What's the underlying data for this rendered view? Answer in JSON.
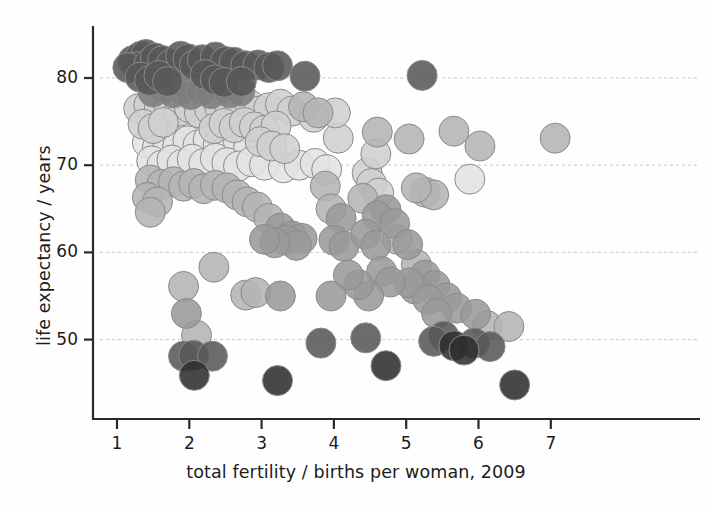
{
  "chart_data": {
    "type": "scatter",
    "title": "",
    "subtitle": "",
    "xlabel": "total fertility / births per woman, 2009",
    "ylabel": "life expectancy / years",
    "xlim": [
      0.55,
      7.6
    ],
    "ylim": [
      42.0,
      85.5
    ],
    "xticks": [
      1,
      2,
      3,
      4,
      5,
      6,
      7
    ],
    "xticklabels": [
      "1",
      "2",
      "3",
      "4",
      "5",
      "6",
      "7"
    ],
    "yticks": [
      50,
      60,
      70,
      80
    ],
    "yticklabels": [
      "50",
      "60",
      "70",
      "80"
    ],
    "grid": "horizontal-dashed-at-yticks",
    "legend": "none",
    "marker": {
      "shape": "circle",
      "radius_px": 15,
      "opacity": 0.88,
      "edge_color": "#8a8a8a",
      "edge_width_px": 1
    },
    "shade_palette": {
      "very-dark": "#2f2f2f",
      "dark": "#585858",
      "mid-dark": "#7d7d7d",
      "mid": "#9a9a9a",
      "mid-light": "#b4b4b4",
      "light": "#cfcfcf",
      "very-light": "#e3e3e3"
    },
    "n_points": 169,
    "points": [
      {
        "x": 1.22,
        "y": 82.0,
        "shade": "dark"
      },
      {
        "x": 1.33,
        "y": 82.5,
        "shade": "dark"
      },
      {
        "x": 1.4,
        "y": 82.7,
        "shade": "dark"
      },
      {
        "x": 1.28,
        "y": 81.3,
        "shade": "dark"
      },
      {
        "x": 1.15,
        "y": 81.2,
        "shade": "dark"
      },
      {
        "x": 1.44,
        "y": 81.6,
        "shade": "dark"
      },
      {
        "x": 1.53,
        "y": 82.3,
        "shade": "dark"
      },
      {
        "x": 1.63,
        "y": 82.0,
        "shade": "dark"
      },
      {
        "x": 1.75,
        "y": 81.6,
        "shade": "dark"
      },
      {
        "x": 1.88,
        "y": 82.5,
        "shade": "dark"
      },
      {
        "x": 1.98,
        "y": 82.2,
        "shade": "dark"
      },
      {
        "x": 2.07,
        "y": 81.5,
        "shade": "dark"
      },
      {
        "x": 2.18,
        "y": 82.1,
        "shade": "dark"
      },
      {
        "x": 2.36,
        "y": 82.4,
        "shade": "dark"
      },
      {
        "x": 2.5,
        "y": 81.9,
        "shade": "dark"
      },
      {
        "x": 2.62,
        "y": 81.8,
        "shade": "dark"
      },
      {
        "x": 2.78,
        "y": 81.4,
        "shade": "dark"
      },
      {
        "x": 2.95,
        "y": 81.5,
        "shade": "dark"
      },
      {
        "x": 3.1,
        "y": 81.2,
        "shade": "dark"
      },
      {
        "x": 3.22,
        "y": 81.4,
        "shade": "dark"
      },
      {
        "x": 1.32,
        "y": 80.1,
        "shade": "dark"
      },
      {
        "x": 1.45,
        "y": 79.7,
        "shade": "dark"
      },
      {
        "x": 1.58,
        "y": 80.3,
        "shade": "dark"
      },
      {
        "x": 1.7,
        "y": 79.6,
        "shade": "dark"
      },
      {
        "x": 1.82,
        "y": 80.0,
        "shade": "mid-dark"
      },
      {
        "x": 1.95,
        "y": 79.4,
        "shade": "mid-dark"
      },
      {
        "x": 2.08,
        "y": 79.9,
        "shade": "mid-dark"
      },
      {
        "x": 2.22,
        "y": 80.4,
        "shade": "dark"
      },
      {
        "x": 2.36,
        "y": 79.8,
        "shade": "dark"
      },
      {
        "x": 2.48,
        "y": 79.5,
        "shade": "dark"
      },
      {
        "x": 2.6,
        "y": 80.2,
        "shade": "mid-dark"
      },
      {
        "x": 2.72,
        "y": 79.6,
        "shade": "dark"
      },
      {
        "x": 1.5,
        "y": 78.4,
        "shade": "mid-dark"
      },
      {
        "x": 1.64,
        "y": 78.8,
        "shade": "mid-dark"
      },
      {
        "x": 1.78,
        "y": 78.3,
        "shade": "mid-dark"
      },
      {
        "x": 1.9,
        "y": 78.7,
        "shade": "mid-dark"
      },
      {
        "x": 2.02,
        "y": 78.1,
        "shade": "mid-dark"
      },
      {
        "x": 2.16,
        "y": 78.6,
        "shade": "mid-dark"
      },
      {
        "x": 2.3,
        "y": 78.2,
        "shade": "mid-dark"
      },
      {
        "x": 2.44,
        "y": 78.9,
        "shade": "mid-dark"
      },
      {
        "x": 2.56,
        "y": 78.3,
        "shade": "mid-dark"
      },
      {
        "x": 2.7,
        "y": 78.5,
        "shade": "mid-dark"
      },
      {
        "x": 3.6,
        "y": 80.2,
        "shade": "dark"
      },
      {
        "x": 5.22,
        "y": 80.3,
        "shade": "dark"
      },
      {
        "x": 1.3,
        "y": 76.5,
        "shade": "light"
      },
      {
        "x": 1.44,
        "y": 76.9,
        "shade": "light"
      },
      {
        "x": 1.58,
        "y": 76.3,
        "shade": "light"
      },
      {
        "x": 1.72,
        "y": 76.8,
        "shade": "light"
      },
      {
        "x": 1.86,
        "y": 76.2,
        "shade": "light"
      },
      {
        "x": 2.0,
        "y": 76.6,
        "shade": "light"
      },
      {
        "x": 2.14,
        "y": 76.0,
        "shade": "light"
      },
      {
        "x": 2.28,
        "y": 76.4,
        "shade": "light"
      },
      {
        "x": 2.42,
        "y": 76.7,
        "shade": "light"
      },
      {
        "x": 2.56,
        "y": 76.1,
        "shade": "light"
      },
      {
        "x": 2.7,
        "y": 76.5,
        "shade": "light"
      },
      {
        "x": 2.84,
        "y": 76.9,
        "shade": "light"
      },
      {
        "x": 2.96,
        "y": 76.2,
        "shade": "light"
      },
      {
        "x": 3.1,
        "y": 76.6,
        "shade": "light"
      },
      {
        "x": 3.26,
        "y": 77.0,
        "shade": "light"
      },
      {
        "x": 3.42,
        "y": 76.2,
        "shade": "light"
      },
      {
        "x": 3.58,
        "y": 76.7,
        "shade": "mid-light"
      },
      {
        "x": 3.78,
        "y": 76.0,
        "shade": "mid-light"
      },
      {
        "x": 1.36,
        "y": 74.7,
        "shade": "light"
      },
      {
        "x": 1.5,
        "y": 74.2,
        "shade": "light"
      },
      {
        "x": 1.64,
        "y": 74.9,
        "shade": "light"
      },
      {
        "x": 1.78,
        "y": 74.3,
        "shade": "very-light"
      },
      {
        "x": 1.92,
        "y": 74.8,
        "shade": "very-light"
      },
      {
        "x": 2.06,
        "y": 74.1,
        "shade": "very-light"
      },
      {
        "x": 2.2,
        "y": 74.6,
        "shade": "very-light"
      },
      {
        "x": 2.34,
        "y": 74.2,
        "shade": "light"
      },
      {
        "x": 2.48,
        "y": 74.8,
        "shade": "light"
      },
      {
        "x": 2.62,
        "y": 74.3,
        "shade": "light"
      },
      {
        "x": 2.76,
        "y": 74.9,
        "shade": "light"
      },
      {
        "x": 2.9,
        "y": 74.4,
        "shade": "light"
      },
      {
        "x": 3.04,
        "y": 74.0,
        "shade": "light"
      },
      {
        "x": 3.2,
        "y": 74.5,
        "shade": "light"
      },
      {
        "x": 1.42,
        "y": 72.6,
        "shade": "very-light"
      },
      {
        "x": 1.56,
        "y": 72.1,
        "shade": "very-light"
      },
      {
        "x": 1.7,
        "y": 72.7,
        "shade": "very-light"
      },
      {
        "x": 1.84,
        "y": 72.2,
        "shade": "very-light"
      },
      {
        "x": 1.98,
        "y": 72.8,
        "shade": "very-light"
      },
      {
        "x": 2.12,
        "y": 72.3,
        "shade": "very-light"
      },
      {
        "x": 2.26,
        "y": 72.9,
        "shade": "very-light"
      },
      {
        "x": 2.4,
        "y": 72.4,
        "shade": "very-light"
      },
      {
        "x": 2.54,
        "y": 72.0,
        "shade": "very-light"
      },
      {
        "x": 2.68,
        "y": 72.6,
        "shade": "very-light"
      },
      {
        "x": 2.82,
        "y": 72.1,
        "shade": "very-light"
      },
      {
        "x": 2.98,
        "y": 72.7,
        "shade": "light"
      },
      {
        "x": 3.14,
        "y": 72.2,
        "shade": "light"
      },
      {
        "x": 3.32,
        "y": 71.9,
        "shade": "light"
      },
      {
        "x": 1.48,
        "y": 70.5,
        "shade": "very-light"
      },
      {
        "x": 1.62,
        "y": 70.0,
        "shade": "very-light"
      },
      {
        "x": 1.76,
        "y": 70.6,
        "shade": "very-light"
      },
      {
        "x": 1.9,
        "y": 70.1,
        "shade": "very-light"
      },
      {
        "x": 2.04,
        "y": 70.7,
        "shade": "very-light"
      },
      {
        "x": 2.2,
        "y": 70.2,
        "shade": "very-light"
      },
      {
        "x": 2.36,
        "y": 70.8,
        "shade": "very-light"
      },
      {
        "x": 2.52,
        "y": 70.3,
        "shade": "very-light"
      },
      {
        "x": 2.68,
        "y": 69.9,
        "shade": "very-light"
      },
      {
        "x": 2.86,
        "y": 70.4,
        "shade": "very-light"
      },
      {
        "x": 3.04,
        "y": 70.0,
        "shade": "very-light"
      },
      {
        "x": 3.3,
        "y": 69.7,
        "shade": "very-light"
      },
      {
        "x": 3.52,
        "y": 70.0,
        "shade": "very-light"
      },
      {
        "x": 3.74,
        "y": 70.2,
        "shade": "very-light"
      },
      {
        "x": 1.46,
        "y": 68.3,
        "shade": "mid-light"
      },
      {
        "x": 1.62,
        "y": 67.8,
        "shade": "mid-light"
      },
      {
        "x": 1.78,
        "y": 68.1,
        "shade": "mid-light"
      },
      {
        "x": 1.92,
        "y": 67.6,
        "shade": "mid-light"
      },
      {
        "x": 2.06,
        "y": 67.9,
        "shade": "mid-light"
      },
      {
        "x": 2.2,
        "y": 67.3,
        "shade": "mid-light"
      },
      {
        "x": 2.36,
        "y": 67.7,
        "shade": "mid-light"
      },
      {
        "x": 1.42,
        "y": 66.3,
        "shade": "mid-light"
      },
      {
        "x": 1.56,
        "y": 65.8,
        "shade": "mid-light"
      },
      {
        "x": 1.46,
        "y": 64.6,
        "shade": "mid-light"
      },
      {
        "x": 2.52,
        "y": 67.4,
        "shade": "mid-light"
      },
      {
        "x": 2.66,
        "y": 66.6,
        "shade": "mid-light"
      },
      {
        "x": 2.8,
        "y": 65.8,
        "shade": "mid-light"
      },
      {
        "x": 2.94,
        "y": 65.2,
        "shade": "mid-light"
      },
      {
        "x": 3.1,
        "y": 63.9,
        "shade": "mid-light"
      },
      {
        "x": 3.26,
        "y": 62.8,
        "shade": "mid"
      },
      {
        "x": 3.42,
        "y": 61.9,
        "shade": "mid"
      },
      {
        "x": 3.56,
        "y": 61.6,
        "shade": "mid"
      },
      {
        "x": 3.34,
        "y": 61.4,
        "shade": "mid"
      },
      {
        "x": 3.48,
        "y": 60.8,
        "shade": "mid"
      },
      {
        "x": 3.18,
        "y": 61.1,
        "shade": "mid"
      },
      {
        "x": 3.04,
        "y": 61.5,
        "shade": "mid"
      },
      {
        "x": 3.88,
        "y": 67.6,
        "shade": "mid-light"
      },
      {
        "x": 3.96,
        "y": 65.0,
        "shade": "mid-light"
      },
      {
        "x": 4.1,
        "y": 63.9,
        "shade": "mid"
      },
      {
        "x": 4.0,
        "y": 61.4,
        "shade": "mid"
      },
      {
        "x": 4.14,
        "y": 60.7,
        "shade": "mid"
      },
      {
        "x": 4.46,
        "y": 69.1,
        "shade": "light"
      },
      {
        "x": 4.52,
        "y": 67.9,
        "shade": "light"
      },
      {
        "x": 4.62,
        "y": 66.8,
        "shade": "light"
      },
      {
        "x": 4.4,
        "y": 66.2,
        "shade": "mid-light"
      },
      {
        "x": 4.72,
        "y": 64.9,
        "shade": "mid"
      },
      {
        "x": 4.6,
        "y": 64.2,
        "shade": "mid"
      },
      {
        "x": 4.84,
        "y": 63.3,
        "shade": "mid"
      },
      {
        "x": 4.44,
        "y": 62.1,
        "shade": "mid"
      },
      {
        "x": 4.58,
        "y": 60.8,
        "shade": "mid"
      },
      {
        "x": 4.88,
        "y": 61.5,
        "shade": "mid-light"
      },
      {
        "x": 5.02,
        "y": 60.9,
        "shade": "mid"
      },
      {
        "x": 5.14,
        "y": 58.6,
        "shade": "mid-light"
      },
      {
        "x": 5.26,
        "y": 57.4,
        "shade": "mid"
      },
      {
        "x": 5.4,
        "y": 56.2,
        "shade": "mid"
      },
      {
        "x": 5.12,
        "y": 55.8,
        "shade": "mid"
      },
      {
        "x": 5.56,
        "y": 54.8,
        "shade": "mid"
      },
      {
        "x": 5.7,
        "y": 53.6,
        "shade": "mid"
      },
      {
        "x": 5.96,
        "y": 52.9,
        "shade": "mid"
      },
      {
        "x": 6.12,
        "y": 51.6,
        "shade": "mid-light"
      },
      {
        "x": 6.42,
        "y": 51.5,
        "shade": "mid-light"
      },
      {
        "x": 5.04,
        "y": 56.5,
        "shade": "mid"
      },
      {
        "x": 5.3,
        "y": 54.6,
        "shade": "mid"
      },
      {
        "x": 5.42,
        "y": 53.0,
        "shade": "mid"
      },
      {
        "x": 4.66,
        "y": 57.8,
        "shade": "mid"
      },
      {
        "x": 4.78,
        "y": 56.6,
        "shade": "mid"
      },
      {
        "x": 4.48,
        "y": 55.0,
        "shade": "mid"
      },
      {
        "x": 4.34,
        "y": 56.3,
        "shade": "mid"
      },
      {
        "x": 4.2,
        "y": 57.4,
        "shade": "mid"
      },
      {
        "x": 3.96,
        "y": 55.0,
        "shade": "mid"
      },
      {
        "x": 5.52,
        "y": 50.4,
        "shade": "dark"
      },
      {
        "x": 5.66,
        "y": 49.3,
        "shade": "very-dark"
      },
      {
        "x": 5.8,
        "y": 48.8,
        "shade": "very-dark"
      },
      {
        "x": 5.94,
        "y": 49.6,
        "shade": "dark"
      },
      {
        "x": 6.16,
        "y": 49.2,
        "shade": "dark"
      },
      {
        "x": 5.38,
        "y": 49.8,
        "shade": "dark"
      },
      {
        "x": 4.44,
        "y": 50.2,
        "shade": "dark"
      },
      {
        "x": 3.82,
        "y": 49.6,
        "shade": "dark"
      },
      {
        "x": 4.72,
        "y": 47.0,
        "shade": "very-dark"
      },
      {
        "x": 6.5,
        "y": 44.8,
        "shade": "very-dark"
      },
      {
        "x": 3.22,
        "y": 45.3,
        "shade": "very-dark"
      },
      {
        "x": 1.92,
        "y": 48.1,
        "shade": "dark"
      },
      {
        "x": 2.06,
        "y": 48.2,
        "shade": "dark"
      },
      {
        "x": 2.32,
        "y": 48.1,
        "shade": "dark"
      },
      {
        "x": 2.07,
        "y": 45.9,
        "shade": "very-dark"
      },
      {
        "x": 2.1,
        "y": 50.5,
        "shade": "mid-light"
      },
      {
        "x": 1.96,
        "y": 53.0,
        "shade": "mid"
      },
      {
        "x": 1.92,
        "y": 56.1,
        "shade": "mid-light"
      },
      {
        "x": 2.34,
        "y": 58.3,
        "shade": "mid-light"
      },
      {
        "x": 2.78,
        "y": 55.1,
        "shade": "mid-light"
      },
      {
        "x": 2.92,
        "y": 55.4,
        "shade": "mid-light"
      },
      {
        "x": 3.26,
        "y": 55.0,
        "shade": "mid"
      },
      {
        "x": 5.26,
        "y": 66.9,
        "shade": "mid-light"
      },
      {
        "x": 5.38,
        "y": 66.6,
        "shade": "mid-light"
      },
      {
        "x": 5.14,
        "y": 67.4,
        "shade": "mid-light"
      },
      {
        "x": 5.66,
        "y": 73.9,
        "shade": "mid-light"
      },
      {
        "x": 5.04,
        "y": 73.0,
        "shade": "mid-light"
      },
      {
        "x": 6.02,
        "y": 72.2,
        "shade": "mid-light"
      },
      {
        "x": 5.88,
        "y": 68.4,
        "shade": "very-light"
      },
      {
        "x": 7.06,
        "y": 73.1,
        "shade": "mid-light"
      },
      {
        "x": 4.6,
        "y": 73.8,
        "shade": "mid-light"
      },
      {
        "x": 4.58,
        "y": 71.3,
        "shade": "light"
      },
      {
        "x": 4.06,
        "y": 73.1,
        "shade": "light"
      },
      {
        "x": 4.02,
        "y": 76.0,
        "shade": "light"
      },
      {
        "x": 3.72,
        "y": 75.5,
        "shade": "light"
      },
      {
        "x": 3.9,
        "y": 69.5,
        "shade": "very-light"
      }
    ]
  },
  "axes": {
    "x_tick_labels": [
      "1",
      "2",
      "3",
      "4",
      "5",
      "6",
      "7"
    ],
    "y_tick_labels": [
      "50",
      "60",
      "70",
      "80"
    ]
  }
}
